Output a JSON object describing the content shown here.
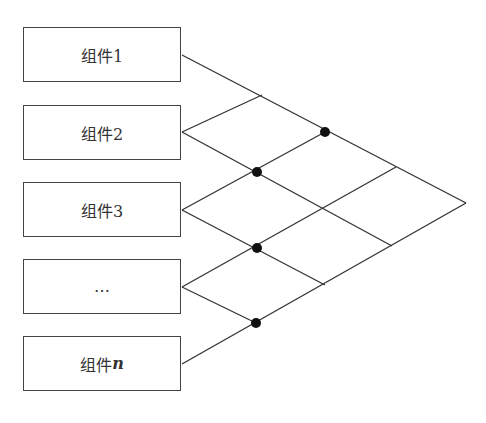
{
  "components": [
    {
      "label": "组件1",
      "suffix": ""
    },
    {
      "label": "组件2",
      "suffix": ""
    },
    {
      "label": "组件3",
      "suffix": ""
    },
    {
      "label": "…",
      "suffix": ""
    },
    {
      "label": "组件",
      "suffix": "n"
    }
  ],
  "colors": {
    "line": "#333333",
    "dot": "#111111",
    "border": "#444444"
  }
}
